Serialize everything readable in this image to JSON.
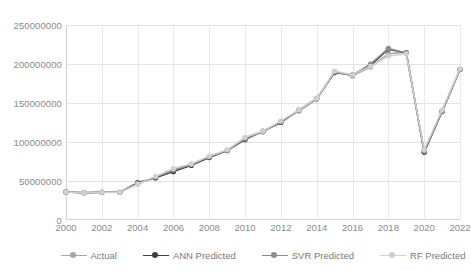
{
  "chart_data": {
    "type": "line",
    "title": "",
    "xlabel": "",
    "ylabel": "",
    "x": [
      2000,
      2001,
      2002,
      2003,
      2004,
      2005,
      2006,
      2007,
      2008,
      2009,
      2010,
      2011,
      2012,
      2013,
      2014,
      2015,
      2016,
      2017,
      2018,
      2019,
      2020,
      2021,
      2022
    ],
    "xlim": [
      2000,
      2022
    ],
    "ylim": [
      0,
      250000000
    ],
    "yticks": [
      0,
      50000000,
      100000000,
      150000000,
      200000000,
      250000000
    ],
    "ytick_labels": [
      "0",
      "50000000",
      "100000000",
      "150000000",
      "200000000",
      "250000000"
    ],
    "xticks": [
      2000,
      2002,
      2004,
      2006,
      2008,
      2010,
      2012,
      2014,
      2016,
      2018,
      2020,
      2022
    ],
    "xtick_labels": [
      "2000",
      "2002",
      "2004",
      "2006",
      "2008",
      "2010",
      "2012",
      "2014",
      "2016",
      "2018",
      "2020",
      "2022"
    ],
    "grid": true,
    "legend_position": "bottom",
    "series": [
      {
        "name": "Actual",
        "color": "#a6a6a6",
        "values": [
          36000000,
          35000000,
          35500000,
          35500000,
          46000000,
          55000000,
          65000000,
          71000000,
          81000000,
          89000000,
          105000000,
          113000000,
          126000000,
          140000000,
          155000000,
          190000000,
          185000000,
          196000000,
          213000000,
          215000000,
          87000000,
          140000000,
          193000000
        ]
      },
      {
        "name": "ANN Predicted",
        "color": "#404040",
        "values": [
          36000000,
          35000000,
          35500000,
          35500000,
          48000000,
          54000000,
          62000000,
          70000000,
          80000000,
          89000000,
          103000000,
          114000000,
          125000000,
          141000000,
          156000000,
          189000000,
          186000000,
          198000000,
          219000000,
          214000000,
          87000000,
          139000000,
          193000000
        ]
      },
      {
        "name": "SVR Predicted",
        "color": "#8c8c8c",
        "values": [
          36000000,
          35000000,
          35500000,
          35500000,
          47000000,
          55000000,
          64000000,
          71000000,
          81000000,
          89000000,
          104000000,
          113000000,
          126000000,
          140000000,
          155000000,
          190000000,
          185000000,
          200000000,
          220000000,
          214000000,
          88000000,
          139000000,
          193000000
        ]
      },
      {
        "name": "RF Predicted",
        "color": "#d0d0d0",
        "values": [
          36000000,
          35000000,
          35500000,
          35500000,
          46000000,
          56000000,
          66000000,
          72000000,
          82000000,
          90000000,
          106000000,
          114000000,
          127000000,
          141000000,
          156000000,
          191000000,
          186000000,
          197000000,
          210000000,
          213000000,
          90000000,
          141000000,
          194000000
        ]
      }
    ]
  }
}
